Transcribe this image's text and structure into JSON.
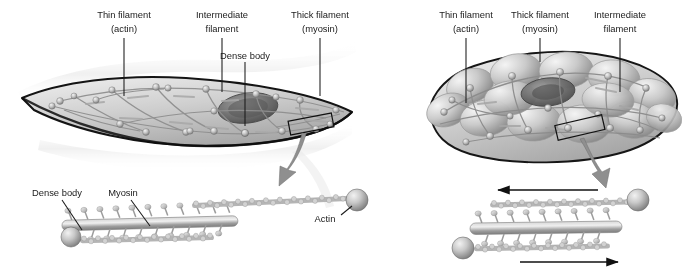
{
  "figure": {
    "type": "biology-diagram",
    "background_color": "#ffffff",
    "ink_color": "#1a1a1a"
  },
  "panels": [
    {
      "id": "relaxed",
      "state": "relaxed",
      "cell_shape": "elongated spindle",
      "labels": [
        {
          "name": "thin-filament",
          "line1": "Thin filament",
          "line2": "(actin)",
          "x": 124,
          "y": 14,
          "leader": {
            "x1": 124,
            "y1": 38,
            "x2": 124,
            "y2": 96
          }
        },
        {
          "name": "intermediate-filament",
          "line1": "Intermediate",
          "line2": "filament",
          "x": 222,
          "y": 14,
          "leader": {
            "x1": 222,
            "y1": 38,
            "x2": 222,
            "y2": 92
          }
        },
        {
          "name": "thick-filament",
          "line1": "Thick filament",
          "line2": "(myosin)",
          "x": 320,
          "y": 14,
          "leader": {
            "x1": 320,
            "y1": 38,
            "x2": 320,
            "y2": 96
          }
        },
        {
          "name": "dense-body",
          "line1": "Dense body",
          "line2": "",
          "x": 245,
          "y": 56,
          "leader": {
            "x1": 245,
            "y1": 62,
            "x2": 245,
            "y2": 126
          }
        }
      ],
      "callout_box": {
        "name": "magnify-box",
        "cx": 311,
        "cy": 124,
        "w": 44,
        "h": 14,
        "rotate": -11
      },
      "zoom_arrow": {
        "from": [
          305,
          136
        ],
        "to": [
          288,
          180
        ]
      }
    },
    {
      "id": "contracted",
      "state": "contracted",
      "cell_shape": "shortened globular",
      "labels": [
        {
          "name": "thin-filament",
          "line1": "Thin filament",
          "line2": "(actin)",
          "x": 466,
          "y": 14,
          "leader": {
            "x1": 466,
            "y1": 38,
            "x2": 466,
            "y2": 103
          }
        },
        {
          "name": "thick-filament",
          "line1": "Thick filament",
          "line2": "(myosin)",
          "x": 540,
          "y": 14,
          "leader": {
            "x1": 540,
            "y1": 38,
            "x2": 540,
            "y2": 62
          }
        },
        {
          "name": "intermediate-filament",
          "line1": "Intermediate",
          "line2": "filament",
          "x": 620,
          "y": 14,
          "leader": {
            "x1": 620,
            "y1": 38,
            "x2": 620,
            "y2": 92
          }
        }
      ],
      "callout_box": {
        "name": "magnify-box",
        "cx": 580,
        "cy": 128,
        "w": 48,
        "h": 15,
        "rotate": -13
      },
      "zoom_arrow": {
        "from": [
          586,
          142
        ],
        "to": [
          600,
          182
        ]
      }
    }
  ],
  "detail_views": [
    {
      "id": "relaxed-detail",
      "name": "contractile-unit-relaxed",
      "labels": [
        {
          "name": "dense-body",
          "text": "Dense body",
          "x": 57,
          "y": 196,
          "leader": {
            "x1": 62,
            "y1": 200,
            "x2": 82,
            "y2": 228
          }
        },
        {
          "name": "myosin",
          "text": "Myosin",
          "x": 120,
          "y": 196,
          "leader": {
            "x1": 128,
            "y1": 200,
            "x2": 148,
            "y2": 226
          }
        },
        {
          "name": "actin",
          "text": "Actin",
          "x": 325,
          "y": 219,
          "leader": {
            "x1": 341,
            "y1": 216,
            "x2": 352,
            "y2": 207
          }
        }
      ],
      "thick_filament": {
        "x": 62,
        "y": 222,
        "w": 175,
        "h": 11,
        "heads": 11
      },
      "actin_top": {
        "x1": 190,
        "y1": 205,
        "x2": 348,
        "y2": 198
      },
      "actin_bottom": {
        "x1": 78,
        "y1": 240,
        "x2": 212,
        "y2": 236
      },
      "dense_bodies": [
        {
          "cx": 71,
          "cy": 237,
          "r": 10
        },
        {
          "cx": 357,
          "cy": 200,
          "r": 11
        }
      ]
    },
    {
      "id": "contracted-detail",
      "name": "contractile-unit-contracted",
      "thick_filament": {
        "x": 470,
        "y": 225,
        "w": 150,
        "h": 12,
        "heads": 9
      },
      "actin_top": {
        "x1": 490,
        "y1": 205,
        "x2": 628,
        "y2": 201
      },
      "actin_bottom": {
        "x1": 474,
        "y1": 248,
        "x2": 608,
        "y2": 244
      },
      "dense_bodies": [
        {
          "cx": 638,
          "cy": 200,
          "r": 11
        },
        {
          "cx": 463,
          "cy": 248,
          "r": 11
        },
        {
          "cx": 357,
          "cy": 200,
          "r": 11
        }
      ],
      "sliding_arrows": [
        {
          "name": "arrow-left",
          "direction": "left",
          "x1": 598,
          "y1": 190,
          "x2": 495,
          "y2": 190
        },
        {
          "name": "arrow-right",
          "direction": "right",
          "x1": 520,
          "y1": 262,
          "x2": 620,
          "y2": 262
        }
      ]
    }
  ],
  "palette": {
    "cell_light": "#e2e2e2",
    "cell_mid": "#c2c2c2",
    "cell_dark": "#8e8e8e",
    "outline": "#1c1c1c",
    "nucleus": "#6a6a6a",
    "filament": "#b9b9b9",
    "arrow_gray": "#8c8c8c"
  }
}
